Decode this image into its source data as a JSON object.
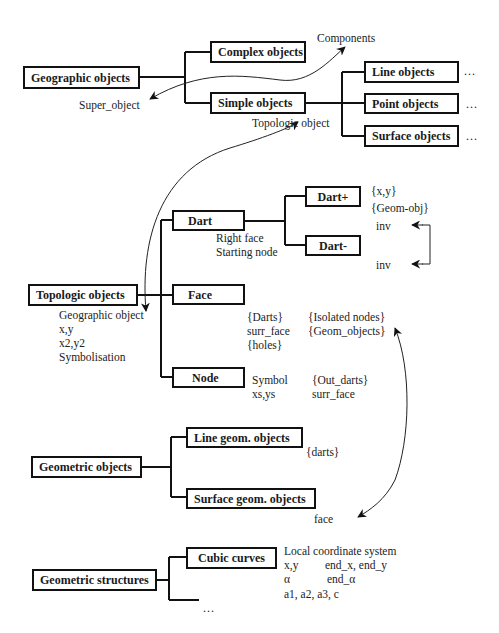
{
  "diagram": {
    "type": "hierarchical object model",
    "geographic": {
      "root": "Geographic objects",
      "complex": "Complex objects",
      "simple": "Simple objects",
      "line": "Line objects",
      "point": "Point objects",
      "surface": "Surface objects",
      "ellipsis": "...",
      "components_label": "Components",
      "super_object_label": "Super_object",
      "topologic_object_label": "Topologic object"
    },
    "topologic": {
      "root": "Topologic objects",
      "root_attrs": [
        "Geographic object",
        "x,y",
        "x2,y2",
        "Symbolisation"
      ],
      "dart": "Dart",
      "dart_attrs": [
        "Right face",
        "Starting node"
      ],
      "dart_plus": "Dart+",
      "dart_plus_attrs": [
        "{x,y}",
        "{Geom-obj}"
      ],
      "dart_minus": "Dart-",
      "inv_top": "inv",
      "inv_bottom": "inv",
      "face": "Face",
      "face_attrs_col1": [
        "{Darts}",
        "surr_face",
        "{holes}"
      ],
      "face_attrs_col2": [
        "{Isolated nodes}",
        "{Geom_objects}"
      ],
      "node": "Node",
      "node_attrs_col1": [
        "Symbol",
        "xs,ys"
      ],
      "node_attrs_col2": [
        "{Out_darts}",
        "surr_face"
      ]
    },
    "geometric": {
      "root": "Geometric objects",
      "line": "Line geom. objects",
      "line_attrs": "{darts}",
      "surface": "Surface geom. objects",
      "surface_attrs": "face"
    },
    "structures": {
      "root": "Geometric structures",
      "cubic": "Cubic curves",
      "cubic_attrs": [
        "Local coordinate system",
        "x,y",
        "end_x, end_y",
        "α",
        "end_α",
        "a1, a2, a3, c"
      ],
      "ellipsis": "..."
    }
  },
  "colors": {
    "line": "#111111",
    "background": "#ffffff"
  }
}
